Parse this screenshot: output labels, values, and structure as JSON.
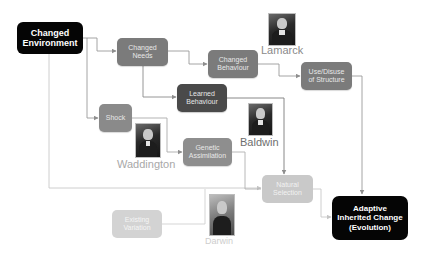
{
  "diagram": {
    "colors": {
      "black_node": "#050505",
      "mid_node": "#7b7b7b",
      "dark_node": "#4a4a4a",
      "light_node": "#c9c9c9",
      "lighter_node": "#d3d3d3",
      "connector": "#9a9a9a",
      "name_lamarck": "#8a8a8a",
      "name_baldwin": "#6e6e6e",
      "name_waddington": "#a8a8a8",
      "name_darwin": "#cdcdcd"
    },
    "nodes": {
      "changed_environment": {
        "line1": "Changed",
        "line2": "Environment"
      },
      "changed_needs": {
        "line1": "Changed",
        "line2": "Needs"
      },
      "changed_behaviour": {
        "line1": "Changed",
        "line2": "Behaviour"
      },
      "use_disuse": {
        "line1": "Use/Disuse",
        "line2": "of Structure"
      },
      "learned_behaviour": {
        "line1": "Learned",
        "line2": "Behaviour"
      },
      "shock": {
        "line1": "Shock"
      },
      "genetic_assimilation": {
        "line1": "Genetic",
        "line2": "Assimilation"
      },
      "natural_selection": {
        "line1": "Natural",
        "line2": "Selection"
      },
      "existing_variation": {
        "line1": "Existing",
        "line2": "Variation"
      },
      "adaptive_change": {
        "line1": "Adaptive",
        "line2": "Inherited Change",
        "line3": "(Evolution)"
      }
    },
    "people": [
      {
        "name": "Lamarck",
        "icon": "portrait-lamarck"
      },
      {
        "name": "Baldwin",
        "icon": "portrait-baldwin"
      },
      {
        "name": "Waddington",
        "icon": "portrait-waddington"
      },
      {
        "name": "Darwin",
        "icon": "portrait-darwin"
      }
    ],
    "edges": [
      {
        "from": "Changed Environment",
        "to": "Changed Needs"
      },
      {
        "from": "Changed Environment",
        "to": "Shock"
      },
      {
        "from": "Changed Environment",
        "to": "Natural Selection"
      },
      {
        "from": "Changed Needs",
        "to": "Changed Behaviour"
      },
      {
        "from": "Changed Needs",
        "to": "Learned Behaviour"
      },
      {
        "from": "Changed Behaviour",
        "to": "Use/Disuse of Structure"
      },
      {
        "from": "Use/Disuse of Structure",
        "to": "Adaptive Inherited Change (Evolution)"
      },
      {
        "from": "Learned Behaviour",
        "to": "Natural Selection"
      },
      {
        "from": "Shock",
        "to": "Genetic Assimilation"
      },
      {
        "from": "Genetic Assimilation",
        "to": "Natural Selection"
      },
      {
        "from": "Existing Variation",
        "to": "Natural Selection"
      },
      {
        "from": "Natural Selection",
        "to": "Adaptive Inherited Change (Evolution)"
      }
    ]
  }
}
